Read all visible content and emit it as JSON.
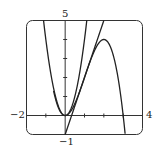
{
  "chart_data": {
    "type": "line",
    "title": "",
    "xlabel": "",
    "ylabel": "",
    "xlim": [
      -2,
      4
    ],
    "ylim": [
      -1,
      5
    ],
    "grid": false,
    "tick_labels": {
      "xmin": "−2",
      "xmax": "4",
      "ymax": "5",
      "ymin": "−1"
    },
    "series": [
      {
        "name": "cubic",
        "expr": "y = -x^3 + 3x^2",
        "x": [
          -0.4,
          0,
          0.5,
          1,
          1.5,
          2,
          2.5,
          3,
          3.2
        ],
        "y": [
          0.54,
          0,
          0.625,
          2,
          3.375,
          4,
          3.125,
          0,
          -1.02
        ]
      },
      {
        "name": "tangent-line",
        "expr": "y = 3x - 1",
        "x": [
          0,
          2
        ],
        "y": [
          -1,
          5
        ]
      },
      {
        "name": "parabola",
        "expr": "y ≈ 4x^2",
        "x": [
          -1.12,
          -0.5,
          0,
          0.5,
          1.12
        ],
        "y": [
          5,
          1,
          0,
          1,
          5
        ]
      }
    ]
  }
}
